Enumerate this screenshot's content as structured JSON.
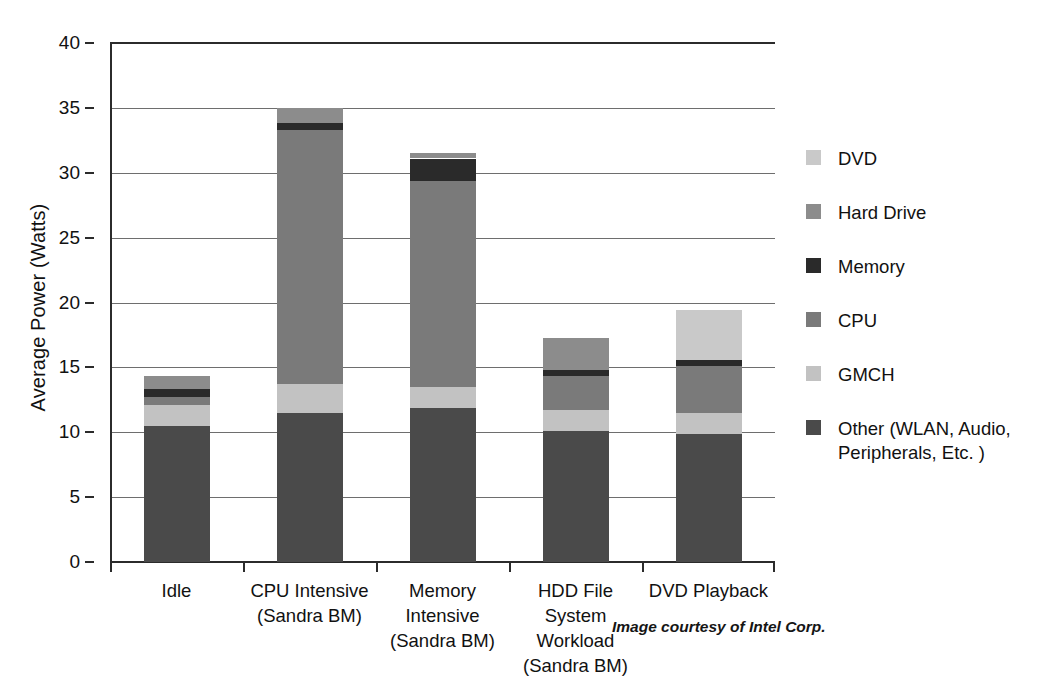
{
  "chart_data": {
    "type": "bar",
    "subtype": "stacked-bar",
    "title": "",
    "xlabel": "",
    "ylabel": "Average Power (Watts)",
    "ylim": [
      0,
      40
    ],
    "ytick_step": 5,
    "yticks": [
      "40",
      "35",
      "30",
      "25",
      "20",
      "15",
      "10",
      "5",
      "0"
    ],
    "grid": true,
    "grid_axis": "y",
    "legend_position": "right",
    "categories": [
      "Idle",
      "CPU Intensive (Sandra BM)",
      "Memory Intensive (Sandra BM)",
      "HDD File System Workload (Sandra BM)",
      "DVD Playback"
    ],
    "category_lines": [
      [
        "Idle"
      ],
      [
        "CPU Intensive",
        "(Sandra BM)"
      ],
      [
        "Memory",
        "Intensive",
        "(Sandra BM)"
      ],
      [
        "HDD File",
        "System",
        "Workload",
        "(Sandra BM)"
      ],
      [
        "DVD Playback"
      ]
    ],
    "series": [
      {
        "name": "Other (WLAN, Audio, Peripherals, Etc. )",
        "color": "#4a4a4a",
        "values": [
          10.5,
          11.5,
          11.9,
          10.1,
          9.9
        ]
      },
      {
        "name": "GMCH",
        "color": "#c2c2c2",
        "values": [
          1.6,
          2.2,
          1.6,
          1.6,
          1.6
        ]
      },
      {
        "name": "CPU",
        "color": "#7a7a7a",
        "values": [
          0.6,
          19.6,
          15.9,
          2.6,
          3.6
        ]
      },
      {
        "name": "Memory",
        "color": "#2a2a2a",
        "values": [
          0.6,
          0.5,
          1.7,
          0.5,
          0.5
        ]
      },
      {
        "name": "Hard Drive",
        "color": "#8c8c8c",
        "values": [
          1.0,
          1.2,
          0.4,
          2.5,
          0.0
        ]
      },
      {
        "name": "DVD",
        "color": "#c9c9c9",
        "values": [
          0.0,
          0.0,
          0.0,
          0.0,
          3.8
        ]
      }
    ],
    "totals": [
      14.3,
      35.0,
      31.5,
      17.3,
      19.4
    ]
  },
  "legend": {
    "items": [
      {
        "label": "DVD",
        "color": "#c9c9c9"
      },
      {
        "label": "Hard Drive",
        "color": "#8c8c8c"
      },
      {
        "label": "Memory",
        "color": "#2a2a2a"
      },
      {
        "label": "CPU",
        "color": "#7a7a7a"
      },
      {
        "label": "GMCH",
        "color": "#c2c2c2"
      },
      {
        "label": "Other (WLAN, Audio,",
        "label2": "Peripherals, Etc. )",
        "color": "#4a4a4a"
      }
    ]
  },
  "attribution": {
    "text": "Image courtesy of Intel Corp."
  }
}
